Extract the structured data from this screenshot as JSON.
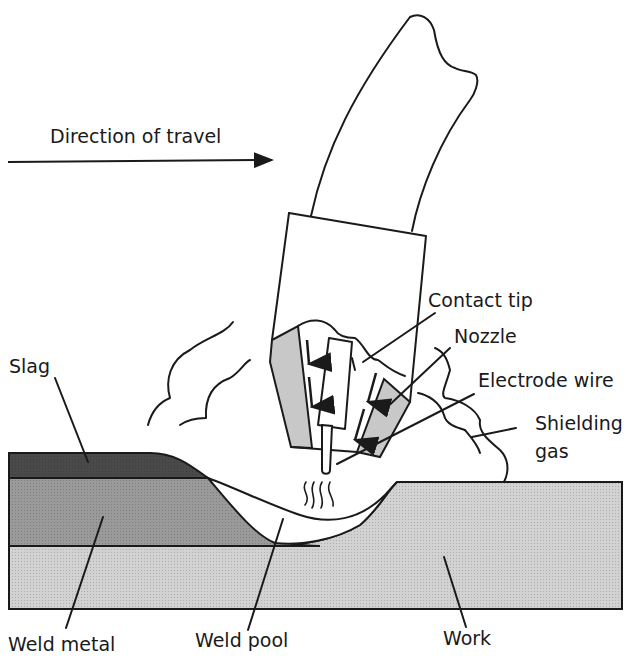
{
  "diagram": {
    "direction_label": "Direction of travel",
    "labels": {
      "contact_tip": "Contact tip",
      "nozzle": "Nozzle",
      "electrode_wire": "Electrode wire",
      "shielding_gas_line1": "Shielding",
      "shielding_gas_line2": "gas",
      "slag": "Slag",
      "weld_metal": "Weld metal",
      "weld_pool": "Weld pool",
      "work": "Work"
    },
    "colors": {
      "ink": "#1a1a1a",
      "slag_fill": "#4a4a4a",
      "weld_metal_fill": "#9a9a9a",
      "work_fill": "#d2d2d2",
      "nozzle_fill": "#c8c8c8",
      "background": "#ffffff"
    }
  }
}
